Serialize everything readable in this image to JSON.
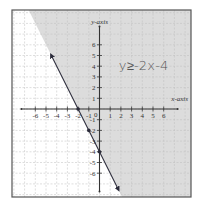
{
  "chart_data": {
    "type": "line",
    "title": "",
    "xlabel": "x-axis",
    "ylabel": "y-axis",
    "xlim": [
      -7.8,
      8.6
    ],
    "ylim": [
      -8.3,
      9.2
    ],
    "grid": true,
    "x_ticks": [
      -6,
      -5,
      -4,
      -3,
      -2,
      -1,
      1,
      2,
      3,
      4,
      5,
      6
    ],
    "y_ticks": [
      -6,
      -5,
      -4,
      -3,
      -2,
      -1,
      1,
      2,
      3,
      4,
      5,
      6
    ],
    "x_tick_labels": [
      "-6",
      "-5",
      "-4",
      "-3",
      "-2",
      "-1",
      "1",
      "2",
      "3",
      "4",
      "5",
      "6"
    ],
    "y_tick_labels": [
      "-6",
      "-5",
      "-4",
      "-3",
      "-2",
      "-1",
      "1",
      "2",
      "3",
      "4",
      "5",
      "6"
    ],
    "origin_label": "0",
    "inequality_label": "y≥-2x-4",
    "boundary": {
      "equation": "y = -2x - 4",
      "slope": -2,
      "intercept": -4,
      "style": "solid",
      "x_range": [
        -4.5,
        1.75
      ],
      "arrows": "both"
    },
    "shaded_region": "above",
    "points": [
      {
        "x": -2,
        "y": 0
      },
      {
        "x": -1,
        "y": -2
      },
      {
        "x": 0,
        "y": -4
      }
    ],
    "colors": {
      "shade": "#dcdcdc",
      "grid": "#bdbdbd",
      "axis": "#333333",
      "line": "#2b2b3a",
      "frame": "#555555"
    }
  }
}
